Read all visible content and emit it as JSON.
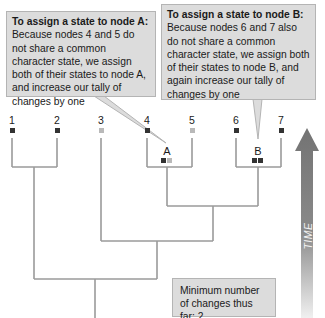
{
  "callouts": {
    "node_a": {
      "title": "To assign a state to node A:",
      "body": "Because nodes 4 and 5 do not share a common character state, we assign both of their states to node A, and increase our tally of changes by one"
    },
    "node_b": {
      "title": "To assign a state to node B:",
      "body": "Because nodes 6 and 7 also do not share a common character state, we assign both of their states to node B, and again increase our tally of changes by one"
    }
  },
  "leaves": [
    {
      "label": "1",
      "state": "dark"
    },
    {
      "label": "2",
      "state": "dark"
    },
    {
      "label": "3",
      "state": "light"
    },
    {
      "label": "4",
      "state": "dark"
    },
    {
      "label": "5",
      "state": "light"
    },
    {
      "label": "6",
      "state": "dark"
    },
    {
      "label": "7",
      "state": "dark"
    }
  ],
  "internal_nodes": [
    {
      "label": "A",
      "states": [
        "dark",
        "light"
      ]
    },
    {
      "label": "B",
      "states": [
        "dark",
        "dark"
      ]
    }
  ],
  "summary": {
    "text": "Minimum number of changes thus far: 2"
  },
  "axis": {
    "label": "TIME"
  },
  "colors": {
    "callout_bg": "#dcdcdc",
    "state_dark": "#333333",
    "state_light": "#b9b9b9",
    "branch": "#9a9a9a",
    "arrow": "#7a7a7a"
  }
}
